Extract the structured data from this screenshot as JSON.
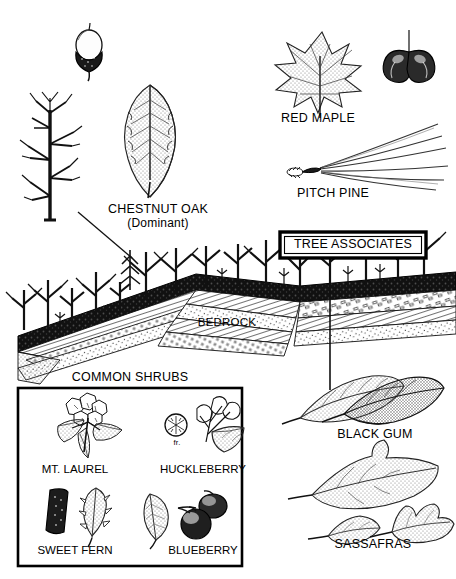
{
  "figure": {
    "title_implicit": "Chestnut Oak Forest Community Profile",
    "colors": {
      "ink": "#000000",
      "paper": "#ffffff",
      "stipple": "#555555"
    }
  },
  "labels": {
    "chestnut_oak": "CHESTNUT OAK",
    "chestnut_oak_sub": "(Dominant)",
    "red_maple": "RED MAPLE",
    "pitch_pine": "PITCH PINE",
    "tree_associates": "TREE ASSOCIATES",
    "bedrock": "BEDROCK",
    "common_shrubs": "COMMON SHRUBS",
    "black_gum": "BLACK GUM",
    "sassafras": "SASSAFRAS"
  },
  "shrub_box": {
    "items": [
      {
        "name": "MT. LAUREL",
        "icon": "mountain-laurel-flower-and-leaves"
      },
      {
        "name": "HUCKLEBERRY",
        "icon": "huckleberry-branch-and-fruit",
        "note": "fr."
      },
      {
        "name": "SWEET FERN",
        "icon": "sweet-fern-catkin-and-leaf"
      },
      {
        "name": "BLUEBERRY",
        "icon": "blueberry-leaf-and-berries"
      }
    ]
  },
  "specimens": [
    {
      "name": "acorn",
      "icon": "acorn-icon"
    },
    {
      "name": "chestnut-oak-leaf",
      "icon": "oak-leaf-icon"
    },
    {
      "name": "chestnut-oak-tree",
      "icon": "bare-tree-icon"
    },
    {
      "name": "red-maple-leaf",
      "icon": "maple-leaf-icon"
    },
    {
      "name": "red-maple-samara",
      "icon": "samara-icon"
    },
    {
      "name": "pitch-pine-needles",
      "icon": "pine-needle-fascicle-icon"
    },
    {
      "name": "black-gum-leaves",
      "icon": "black-gum-leaf-icon"
    },
    {
      "name": "sassafras-leaves",
      "icon": "sassafras-leaf-icon"
    }
  ]
}
